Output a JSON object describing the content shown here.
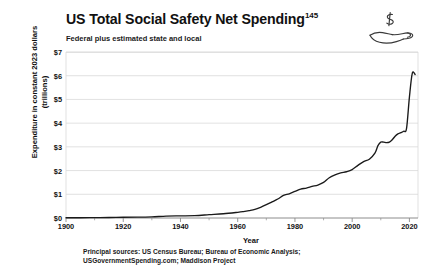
{
  "header": {
    "title": "US Total Social Safety Net Spending",
    "title_superscript": "145",
    "subtitle": "Federal plus estimated state and local",
    "icon": "hand-holding-dollar-icon"
  },
  "footer": {
    "sources_line1": "Principal sources: US Census Bureau; Bureau of Economic Analysis;",
    "sources_line2": "USGovernmentSpending.com; Maddison Project"
  },
  "colors": {
    "line": "#1a1a1a",
    "grid": "#d9d9d9",
    "axis": "#8c8c8c",
    "background": "#ffffff",
    "text": "#111111"
  },
  "chart_data": {
    "type": "line",
    "title": "US Total Social Safety Net Spending",
    "subtitle": "Federal plus estimated state and local",
    "xlabel": "Year",
    "ylabel": "Expenditure in constant 2023 dollars (trillions)",
    "xlim": [
      1900,
      2023
    ],
    "ylim": [
      0,
      7
    ],
    "xticks": [
      1900,
      1920,
      1940,
      1960,
      1980,
      2000,
      2020
    ],
    "xtick_labels": [
      "1900",
      "1920",
      "1940",
      "1960",
      "1980",
      "2000",
      "2020"
    ],
    "xminor_step": 10,
    "yticks": [
      0,
      1,
      2,
      3,
      4,
      5,
      6,
      7
    ],
    "ytick_labels": [
      "$0",
      "$1",
      "$2",
      "$3",
      "$4",
      "$5",
      "$6",
      "$7"
    ],
    "grid": "horizontal",
    "legend": "none",
    "series": [
      {
        "name": "Total social safety net spending",
        "color": "#1a1a1a",
        "x": [
          1900,
          1905,
          1910,
          1915,
          1920,
          1925,
          1930,
          1935,
          1940,
          1945,
          1950,
          1955,
          1960,
          1962,
          1964,
          1966,
          1968,
          1970,
          1972,
          1974,
          1976,
          1978,
          1980,
          1982,
          1984,
          1986,
          1988,
          1990,
          1992,
          1994,
          1996,
          1998,
          2000,
          2002,
          2004,
          2006,
          2008,
          2009,
          2010,
          2011,
          2012,
          2013,
          2014,
          2015,
          2016,
          2017,
          2018,
          2019,
          2020,
          2021,
          2022
        ],
        "y": [
          0.01,
          0.01,
          0.015,
          0.02,
          0.03,
          0.035,
          0.05,
          0.08,
          0.09,
          0.1,
          0.14,
          0.18,
          0.24,
          0.27,
          0.31,
          0.36,
          0.45,
          0.56,
          0.68,
          0.8,
          0.95,
          1.02,
          1.12,
          1.22,
          1.26,
          1.33,
          1.39,
          1.5,
          1.7,
          1.82,
          1.9,
          1.95,
          2.04,
          2.22,
          2.38,
          2.48,
          2.75,
          3.05,
          3.2,
          3.2,
          3.18,
          3.2,
          3.3,
          3.45,
          3.55,
          3.6,
          3.66,
          3.78,
          5.1,
          6.1,
          6.05
        ]
      }
    ],
    "annotations": []
  }
}
